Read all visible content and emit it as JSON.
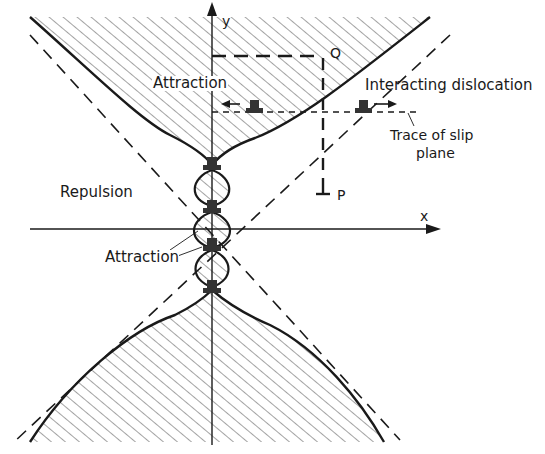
{
  "figure": {
    "type": "dislocation interaction diagram",
    "axes": {
      "x_label": "x",
      "y_label": "y"
    },
    "regions": {
      "attraction_upper": "Attraction",
      "repulsion_left": "Repulsion",
      "attraction_center": "Attraction"
    },
    "annotations": {
      "interacting_dislocation": "Interacting dislocation",
      "trace_line1": "Trace of slip",
      "trace_line2": "plane",
      "point_q": "Q",
      "point_p": "P"
    },
    "colors": {
      "ink": "#1a1a1a",
      "hatch": "#555555",
      "background": "#ffffff"
    }
  }
}
